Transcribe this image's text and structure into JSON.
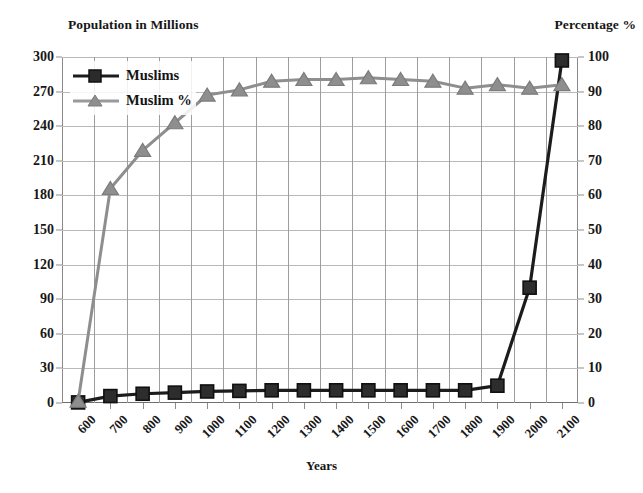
{
  "chart_data": {
    "type": "line",
    "title": "",
    "xlabel": "Years",
    "ylabel": "Population in Millions",
    "y2label": "Percentage %",
    "grid": true,
    "legend_position": "top-left",
    "x": [
      600,
      700,
      800,
      900,
      1000,
      1100,
      1200,
      1300,
      1400,
      1500,
      1600,
      1700,
      1800,
      1900,
      2000,
      2100
    ],
    "categories": [
      "600",
      "700",
      "800",
      "900",
      "1000",
      "1100",
      "1200",
      "1300",
      "1400",
      "1500",
      "1600",
      "1700",
      "1800",
      "1900",
      "2000",
      "2100"
    ],
    "ylim": [
      0,
      300
    ],
    "yticks": [
      0,
      30,
      60,
      90,
      120,
      150,
      180,
      210,
      240,
      270,
      300
    ],
    "y2lim": [
      0,
      100
    ],
    "y2ticks": [
      0,
      10,
      20,
      30,
      40,
      50,
      60,
      70,
      80,
      90,
      100
    ],
    "series": [
      {
        "name": "Muslims",
        "axis": "left",
        "unit": "millions",
        "color": "#1c1c1c",
        "marker": "square",
        "values": [
          0.5,
          6,
          8,
          9,
          10,
          10.5,
          11,
          11,
          11,
          11,
          11,
          11,
          11,
          15,
          100,
          297
        ]
      },
      {
        "name": "Muslim %",
        "axis": "right",
        "unit": "percent",
        "color": "#8e8e8e",
        "marker": "triangle",
        "values": [
          0.5,
          62,
          73,
          81,
          89,
          90.5,
          93,
          93.5,
          93.5,
          94,
          93.5,
          93,
          91,
          92,
          91,
          92
        ]
      }
    ]
  },
  "legend": {
    "items": [
      {
        "label": "Muslims"
      },
      {
        "label": "Muslim %"
      }
    ]
  },
  "axes": {
    "left_title": "Population in Millions",
    "right_title": "Percentage %",
    "x_title": "Years"
  }
}
